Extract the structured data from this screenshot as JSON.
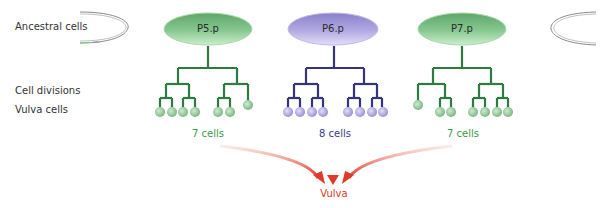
{
  "row_labels": {
    "ancestral": "Ancestral cells",
    "divisions": "Cell divisions",
    "vulva_cells": "Vulva cells"
  },
  "cells": [
    {
      "name": "P5.p",
      "count_label": "7 cells",
      "color": "#3a8a4a",
      "fill_light": "#c8ecc8",
      "fill_dark": "#5ea66a"
    },
    {
      "name": "P6.p",
      "count_label": "8 cells",
      "color": "#3b3a8a",
      "fill_light": "#e0dcf6",
      "fill_dark": "#8a80cc"
    },
    {
      "name": "P7.p",
      "count_label": "7 cells",
      "color": "#3a8a4a",
      "fill_light": "#c8ecc8",
      "fill_dark": "#5ea66a"
    }
  ],
  "target": {
    "label": "Vulva",
    "color": "#e03a2a"
  }
}
